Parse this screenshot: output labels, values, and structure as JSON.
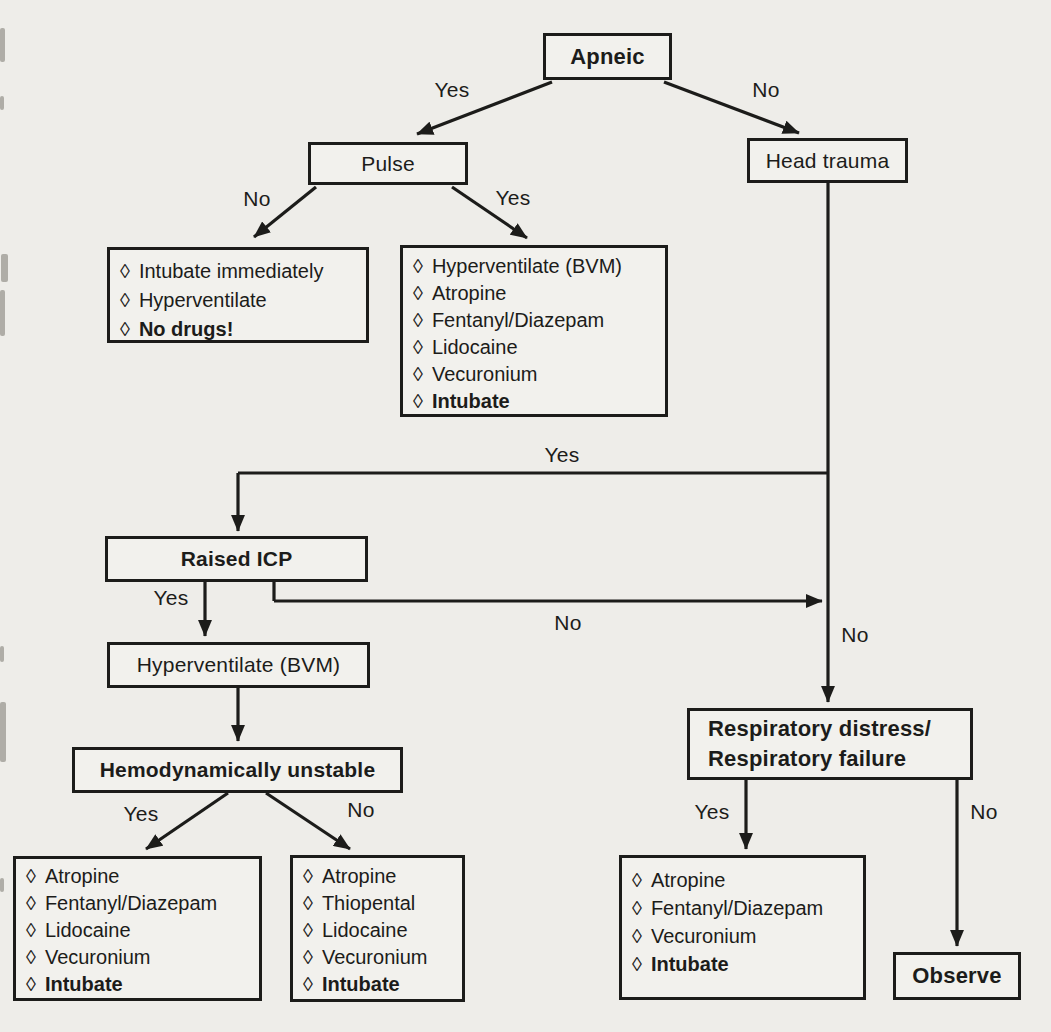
{
  "colors": {
    "ink": "#1c1c1a",
    "paper": "#eeede9",
    "box_fill": "#f2f1ed"
  },
  "glyphs": {
    "diamond": "◊"
  },
  "nodes": {
    "apneic": {
      "label": "Apneic"
    },
    "pulse": {
      "label": "Pulse"
    },
    "head_trauma": {
      "label": "Head trauma"
    },
    "raised_icp": {
      "label": "Raised ICP"
    },
    "hyperventilate_bvm": {
      "label": "Hyperventilate (BVM)"
    },
    "hemodynamically_unstable": {
      "label": "Hemodynamically unstable"
    },
    "respiratory": {
      "line1": "Respiratory distress/",
      "line2": "Respiratory failure"
    },
    "observe": {
      "label": "Observe"
    }
  },
  "action_boxes": {
    "pulse_no": {
      "items": [
        {
          "text": "Intubate immediately",
          "bold": false
        },
        {
          "text": "Hyperventilate",
          "bold": false
        },
        {
          "text": "No drugs!",
          "bold": true
        }
      ]
    },
    "pulse_yes": {
      "items": [
        {
          "text": "Hyperventilate (BVM)",
          "bold": false
        },
        {
          "text": "Atropine",
          "bold": false
        },
        {
          "text": "Fentanyl/Diazepam",
          "bold": false
        },
        {
          "text": "Lidocaine",
          "bold": false
        },
        {
          "text": "Vecuronium",
          "bold": false
        },
        {
          "text": "Intubate",
          "bold": true
        }
      ]
    },
    "unstable_yes": {
      "items": [
        {
          "text": "Atropine",
          "bold": false
        },
        {
          "text": "Fentanyl/Diazepam",
          "bold": false
        },
        {
          "text": "Lidocaine",
          "bold": false
        },
        {
          "text": "Vecuronium",
          "bold": false
        },
        {
          "text": "Intubate",
          "bold": true
        }
      ]
    },
    "unstable_no": {
      "items": [
        {
          "text": "Atropine",
          "bold": false
        },
        {
          "text": "Thiopental",
          "bold": false
        },
        {
          "text": "Lidocaine",
          "bold": false
        },
        {
          "text": "Vecuronium",
          "bold": false
        },
        {
          "text": "Intubate",
          "bold": true
        }
      ]
    },
    "respiratory_yes": {
      "items": [
        {
          "text": "Atropine",
          "bold": false
        },
        {
          "text": "Fentanyl/Diazepam",
          "bold": false
        },
        {
          "text": "Vecuronium",
          "bold": false
        },
        {
          "text": "Intubate",
          "bold": true
        }
      ]
    }
  },
  "edge_labels": {
    "apneic_yes": "Yes",
    "apneic_no": "No",
    "pulse_no": "No",
    "pulse_yes": "Yes",
    "head_trauma_yes": "Yes",
    "head_trauma_no": "No",
    "raised_icp_yes": "Yes",
    "raised_icp_no": "No",
    "unstable_yes": "Yes",
    "unstable_no": "No",
    "respiratory_yes": "Yes",
    "respiratory_no": "No"
  }
}
